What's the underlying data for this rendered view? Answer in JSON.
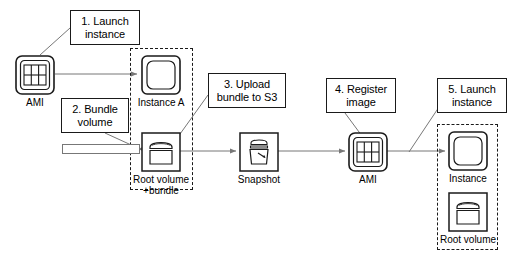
{
  "diagram": {
    "type": "flow-diagram",
    "background_color": "#ffffff",
    "stroke_color": "#1a1a1a",
    "line_color": "#777777"
  },
  "callouts": [
    {
      "id": "step1",
      "label": "1. Launch\ninstance",
      "line1": "1. Launch",
      "line2": "instance",
      "x": 70,
      "y": 10,
      "w": 70,
      "h": 35
    },
    {
      "id": "step2",
      "label": "2. Bundle\nvolume",
      "line1": "2. Bundle",
      "line2": "volume",
      "x": 61,
      "y": 98,
      "w": 68,
      "h": 35
    },
    {
      "id": "step3",
      "label": "3. Upload\nbundle to S3",
      "line1": "3. Upload",
      "line2": "bundle to S3",
      "x": 208,
      "y": 73,
      "w": 78,
      "h": 35
    },
    {
      "id": "step4",
      "label": "4. Register\nimage",
      "line1": "4. Register",
      "line2": "image",
      "x": 326,
      "y": 78,
      "w": 70,
      "h": 35
    },
    {
      "id": "step5",
      "label": "5. Launch\ninstance",
      "line1": "5. Launch",
      "line2": "instance",
      "x": 437,
      "y": 78,
      "w": 70,
      "h": 35
    }
  ],
  "nodes": [
    {
      "id": "ami-source",
      "icon": "ami-icon",
      "label": "AMI",
      "x": 15,
      "y": 55,
      "size": 38
    },
    {
      "id": "instance-a",
      "icon": "instance-icon",
      "label": "Instance A",
      "x": 141,
      "y": 55,
      "size": 38
    },
    {
      "id": "root-volume-bundle",
      "icon": "volume-icon",
      "label": "Root volume\n+bundle",
      "label_line1": "Root volume",
      "label_line2": "+bundle",
      "x": 141,
      "y": 132,
      "size": 38
    },
    {
      "id": "snapshot",
      "icon": "snapshot-icon",
      "label": "Snapshot",
      "x": 239,
      "y": 132,
      "size": 38
    },
    {
      "id": "ami-registered",
      "icon": "ami-icon",
      "label": "AMI",
      "x": 348,
      "y": 132,
      "size": 38
    },
    {
      "id": "instance-new",
      "icon": "instance-icon",
      "label": "Instance",
      "x": 448,
      "y": 131,
      "size": 38
    },
    {
      "id": "root-volume-new",
      "icon": "volume-icon",
      "label": "Root volume",
      "x": 448,
      "y": 192,
      "size": 38
    }
  ],
  "groups": [
    {
      "id": "group-instance-a",
      "x": 130,
      "y": 48,
      "w": 63,
      "h": 142
    },
    {
      "id": "group-instance-new",
      "x": 437,
      "y": 124,
      "w": 61,
      "h": 126
    }
  ],
  "bundle_bar": {
    "id": "bundle-volume-bar",
    "x": 62,
    "y": 144,
    "w": 78,
    "h": 10
  },
  "icon_names": {
    "ami": "ami-grid-icon",
    "instance": "instance-rounded-square-icon",
    "volume": "volume-drum-icon",
    "snapshot": "snapshot-bucket-icon"
  }
}
